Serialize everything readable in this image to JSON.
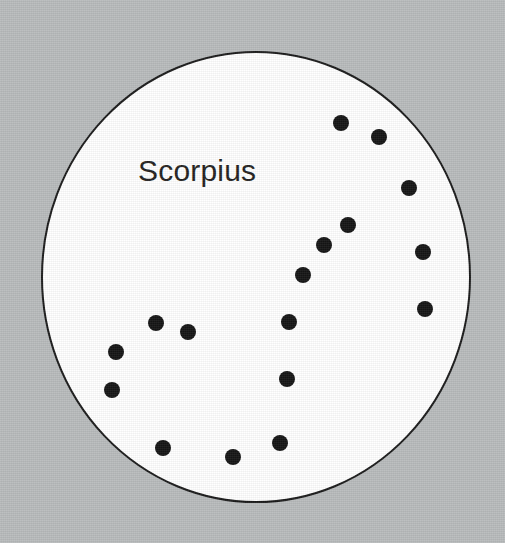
{
  "figure": {
    "kind": "constellation-star-chart",
    "background_color": "#b8bbbc",
    "disc_color": "#ffffff",
    "disc_outline_color": "#1a1a1a",
    "star_color": "#141414",
    "label_color": "#231f20"
  },
  "label": {
    "text": "Scorpius",
    "x": 138,
    "y": 156,
    "font_size": 30
  },
  "disc": {
    "cx": 256,
    "cy": 277,
    "rx": 214,
    "ry": 225,
    "stroke_width": 2
  },
  "chart_data": {
    "type": "scatter",
    "title": "Scorpius",
    "xlabel": "",
    "ylabel": "",
    "xlim": [
      0,
      505
    ],
    "ylim": [
      0,
      543
    ],
    "grid": false,
    "legend": null,
    "marker_diameter": 16,
    "point_count": 16,
    "annotations": [
      "Scorpius"
    ],
    "series": [
      {
        "name": "Scorpius stars",
        "color": "#141414",
        "points": [
          {
            "id": "star-1",
            "x": 341,
            "y": 123,
            "d": 16,
            "group": "tail-tip"
          },
          {
            "id": "star-2",
            "x": 379,
            "y": 137,
            "d": 16,
            "group": "tail-tip"
          },
          {
            "id": "star-3",
            "x": 409,
            "y": 188,
            "d": 16,
            "group": "tail-curve"
          },
          {
            "id": "star-4",
            "x": 423,
            "y": 252,
            "d": 16,
            "group": "tail-curve"
          },
          {
            "id": "star-5",
            "x": 425,
            "y": 309,
            "d": 16,
            "group": "tail-curve"
          },
          {
            "id": "star-6",
            "x": 348,
            "y": 225,
            "d": 16,
            "group": "tail-bend"
          },
          {
            "id": "star-7",
            "x": 324,
            "y": 245,
            "d": 16,
            "group": "tail-bend"
          },
          {
            "id": "star-8",
            "x": 303,
            "y": 275,
            "d": 16,
            "group": "tail-bend"
          },
          {
            "id": "star-9",
            "x": 289,
            "y": 322,
            "d": 16,
            "group": "body"
          },
          {
            "id": "star-10",
            "x": 287,
            "y": 379,
            "d": 16,
            "group": "body"
          },
          {
            "id": "star-11",
            "x": 156,
            "y": 323,
            "d": 16,
            "group": "claw"
          },
          {
            "id": "star-12",
            "x": 188,
            "y": 332,
            "d": 16,
            "group": "claw"
          },
          {
            "id": "star-13",
            "x": 116,
            "y": 352,
            "d": 16,
            "group": "claw"
          },
          {
            "id": "star-14",
            "x": 112,
            "y": 390,
            "d": 16,
            "group": "claw"
          },
          {
            "id": "star-15",
            "x": 163,
            "y": 448,
            "d": 16,
            "group": "lower-body"
          },
          {
            "id": "star-16",
            "x": 233,
            "y": 457,
            "d": 16,
            "group": "lower-body"
          },
          {
            "id": "star-17",
            "x": 280,
            "y": 443,
            "d": 16,
            "group": "lower-body"
          }
        ]
      }
    ]
  }
}
